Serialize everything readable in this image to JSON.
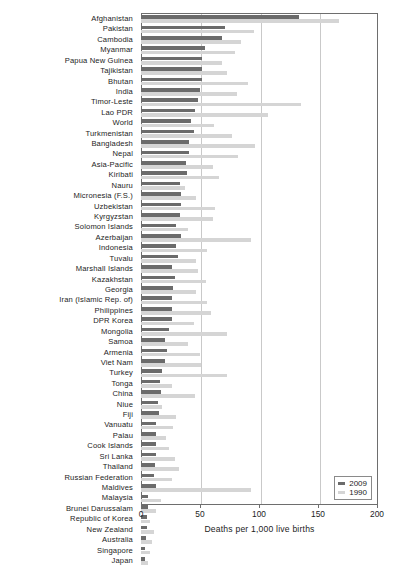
{
  "chart_data": {
    "type": "bar",
    "orientation": "horizontal",
    "title": "",
    "xlabel": "Deaths per 1,000 live births",
    "ylabel": "",
    "xlim": [
      0,
      200
    ],
    "xticks": [
      0,
      50,
      100,
      150,
      200
    ],
    "xtick_labels": [
      "0",
      "50",
      "100",
      "150",
      "200"
    ],
    "grid": true,
    "grid_axis": "x",
    "legend_position": "lower right",
    "categories": [
      "Afghanistan",
      "Pakistan",
      "Cambodia",
      "Myanmar",
      "Papua New Guinea",
      "Tajikistan",
      "Bhutan",
      "India",
      "Timor-Leste",
      "Lao PDR",
      "World",
      "Turkmenistan",
      "Bangladesh",
      "Nepal",
      "Asia-Pacific",
      "Kiribati",
      "Nauru",
      "Micronesia (F.S.)",
      "Uzbekistan",
      "Kyrgyzstan",
      "Solomon Islands",
      "Azerbaijan",
      "Indonesia",
      "Tuvalu",
      "Marshall Islands",
      "Kazakhstan",
      "Georgia",
      "Iran (Islamic Rep. of)",
      "Philippines",
      "DPR Korea",
      "Mongolia",
      "Samoa",
      "Armenia",
      "Viet Nam",
      "Turkey",
      "Tonga",
      "China",
      "Niue",
      "Fiji",
      "Vanuatu",
      "Palau",
      "Cook Islands",
      "Sri Lanka",
      "Thailand",
      "Russian Federation",
      "Maldives",
      "Malaysia",
      "Brunei Darussalam",
      "Republic of Korea",
      "New Zealand",
      "Australia",
      "Singapore",
      "Japan"
    ],
    "series": [
      {
        "name": "2009",
        "color": "#6b6b6b",
        "values": [
          134,
          71,
          69,
          54,
          52,
          52,
          52,
          50,
          48,
          46,
          42,
          45,
          41,
          41,
          38,
          39,
          33,
          34,
          34,
          33,
          30,
          34,
          30,
          31,
          26,
          29,
          27,
          26,
          26,
          26,
          24,
          20,
          22,
          20,
          18,
          16,
          17,
          14,
          15,
          13,
          13,
          13,
          13,
          12,
          11,
          13,
          6,
          6,
          5,
          5,
          4,
          3,
          3
        ]
      },
      {
        "name": "1990",
        "color": "#d5d5d5",
        "values": [
          168,
          96,
          85,
          80,
          69,
          73,
          91,
          81,
          136,
          108,
          62,
          77,
          97,
          82,
          61,
          66,
          37,
          47,
          63,
          61,
          40,
          93,
          56,
          47,
          48,
          55,
          47,
          56,
          59,
          45,
          73,
          40,
          50,
          51,
          73,
          26,
          46,
          18,
          30,
          27,
          21,
          24,
          29,
          32,
          26,
          93,
          17,
          13,
          8,
          11,
          9,
          8,
          6
        ]
      }
    ]
  },
  "legend": {
    "entries": [
      {
        "label": "2009",
        "color": "#6b6b6b"
      },
      {
        "label": "1990",
        "color": "#d5d5d5"
      }
    ]
  }
}
